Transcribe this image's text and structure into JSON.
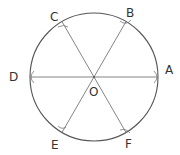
{
  "diagram": {
    "type": "geometry-construction",
    "colors": {
      "stroke": "#555555",
      "label": "#333333",
      "background": "#ffffff"
    },
    "circle": {
      "cx": 94,
      "cy": 77,
      "r": 64
    },
    "center": {
      "label": "O",
      "x": 94,
      "y": 77
    },
    "points": [
      {
        "label": "A",
        "angle": 0
      },
      {
        "label": "B",
        "angle": 60
      },
      {
        "label": "C",
        "angle": 120
      },
      {
        "label": "D",
        "angle": 180
      },
      {
        "label": "E",
        "angle": 240
      },
      {
        "label": "F",
        "angle": 300
      }
    ],
    "segments": [
      "AD",
      "BE",
      "CF"
    ]
  }
}
